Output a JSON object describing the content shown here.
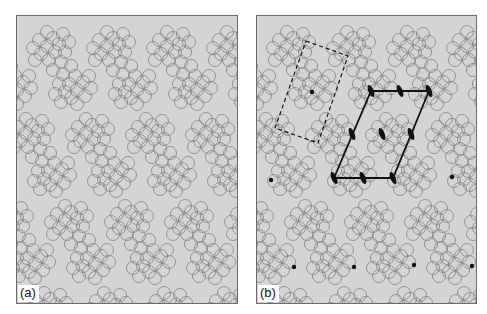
{
  "figure": {
    "panels": [
      {
        "id": "a",
        "label": "(a)",
        "description": "Periodic 2D pattern of circle clusters"
      },
      {
        "id": "b",
        "label": "(b)",
        "description": "Same pattern with motif, lattice unit cell and 2-fold rotation axes marked"
      }
    ],
    "colors": {
      "background": "#d4d4d4",
      "circle_stroke": "#8a8a8a",
      "annotation": "#111111",
      "frame": "#6a6a6a"
    },
    "annotations_b": {
      "motif_box": {
        "style": "dashed",
        "corners": [
          [
            306,
            41
          ],
          [
            348,
            56
          ],
          [
            318,
            143
          ],
          [
            275,
            128
          ]
        ],
        "center_dot": [
          312,
          92
        ]
      },
      "unit_cell": {
        "style": "solid",
        "vertices": [
          [
            371,
            91
          ],
          [
            429,
            91
          ],
          [
            393,
            178
          ],
          [
            334,
            178
          ]
        ]
      },
      "twofold_axes": [
        [
          371,
          91
        ],
        [
          400,
          91
        ],
        [
          429,
          91
        ],
        [
          352,
          134
        ],
        [
          411,
          134
        ],
        [
          382,
          134
        ],
        [
          334,
          178
        ],
        [
          363,
          178
        ],
        [
          393,
          178
        ]
      ],
      "lattice_points": [
        [
          271,
          180
        ],
        [
          452,
          177
        ],
        [
          294,
          267
        ],
        [
          354,
          267
        ],
        [
          414,
          265
        ],
        [
          472,
          266
        ]
      ]
    }
  }
}
